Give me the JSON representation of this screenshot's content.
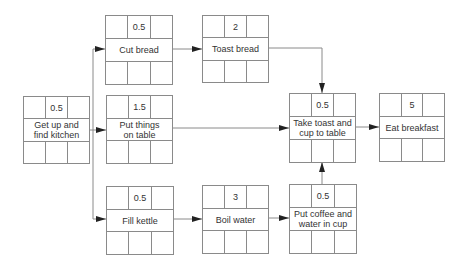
{
  "nodes": [
    {
      "id": "get-up",
      "duration": "0.5",
      "label": "Get up and find kitchen"
    },
    {
      "id": "cut-bread",
      "duration": "0.5",
      "label": "Cut bread"
    },
    {
      "id": "toast-bread",
      "duration": "2",
      "label": "Toast bread"
    },
    {
      "id": "put-things",
      "duration": "1.5",
      "label": "Put things on table"
    },
    {
      "id": "take-toast",
      "duration": "0.5",
      "label": "Take toast and cup to table"
    },
    {
      "id": "eat-breakfast",
      "duration": "5",
      "label": "Eat breakfast"
    },
    {
      "id": "fill-kettle",
      "duration": "0.5",
      "label": "Fill kettle"
    },
    {
      "id": "boil-water",
      "duration": "3",
      "label": "Boil water"
    },
    {
      "id": "put-coffee",
      "duration": "0.5",
      "label": "Put coffee and water in cup"
    }
  ],
  "edges": [
    {
      "from": "get-up",
      "to": "cut-bread"
    },
    {
      "from": "get-up",
      "to": "put-things"
    },
    {
      "from": "get-up",
      "to": "fill-kettle"
    },
    {
      "from": "cut-bread",
      "to": "toast-bread"
    },
    {
      "from": "toast-bread",
      "to": "take-toast"
    },
    {
      "from": "put-things",
      "to": "take-toast"
    },
    {
      "from": "fill-kettle",
      "to": "boil-water"
    },
    {
      "from": "boil-water",
      "to": "put-coffee"
    },
    {
      "from": "put-coffee",
      "to": "take-toast"
    },
    {
      "from": "take-toast",
      "to": "eat-breakfast"
    }
  ],
  "labels": {
    "get_up_l1": "Get up and",
    "get_up_l2": "find kitchen",
    "put_things_l1": "Put things",
    "put_things_l2": "on table",
    "take_toast_l1": "Take toast and",
    "take_toast_l2": "cup to table",
    "put_coffee_l1": "Put coffee and",
    "put_coffee_l2": "water in cup"
  },
  "colors": {
    "line": "#8a8a8a",
    "arrow": "#222222",
    "text": "#333333"
  }
}
